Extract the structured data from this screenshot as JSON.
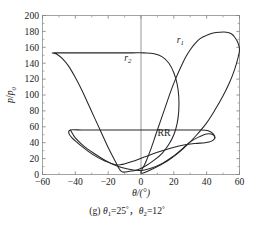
{
  "figure": {
    "caption": "(g) θ1=25°，θ2=12°",
    "caption_parts": {
      "index": "(g)",
      "theta": "θ",
      "sub1": "1",
      "eq1": "=25",
      "deg1": "°",
      "comma": "，",
      "sub2": "2",
      "eq2": "=12",
      "deg2": "°"
    }
  },
  "chart_data": {
    "type": "line",
    "title": "",
    "xlabel": "θ/(°)",
    "ylabel": "p/p0",
    "ylabel_parts": {
      "num": "p",
      "den": "p",
      "den_sub": "0",
      "slash": "/"
    },
    "xlim": [
      -60,
      60
    ],
    "ylim": [
      0,
      200
    ],
    "xticks": [
      -60,
      -40,
      -20,
      0,
      20,
      40,
      60
    ],
    "xticklabels": [
      "-60",
      "-40",
      "-20",
      "0",
      "20",
      "40",
      "60"
    ],
    "yticks": [
      0,
      20,
      40,
      60,
      80,
      100,
      120,
      140,
      160,
      180,
      200
    ],
    "yticklabels": [
      "0",
      "20",
      "40",
      "60",
      "80",
      "100",
      "120",
      "140",
      "160",
      "180",
      "200"
    ],
    "x_minor_interval": 10,
    "y_minor_interval": 10,
    "grid": false,
    "legend": "none",
    "annotations": [
      {
        "text": "r",
        "sub": "1",
        "x": 24,
        "y": 166,
        "name": "curve-label-r1"
      },
      {
        "text": "r",
        "sub": "2",
        "x": -8,
        "y": 143,
        "name": "curve-label-r2"
      },
      {
        "text": "RR",
        "sub": "",
        "x": 14,
        "y": 48,
        "name": "region-label-rr"
      }
    ],
    "vertical_reference_line_x": 0,
    "series": [
      {
        "name": "r1",
        "closed": true,
        "description": "Outer shock polar loop peaking near p/p0 = 180 on the right",
        "points": [
          [
            0,
            2
          ],
          [
            3,
            16
          ],
          [
            6,
            32
          ],
          [
            9,
            50
          ],
          [
            12,
            68
          ],
          [
            15,
            86
          ],
          [
            18,
            104
          ],
          [
            21,
            120
          ],
          [
            24,
            134
          ],
          [
            27,
            147
          ],
          [
            30,
            157
          ],
          [
            33,
            165
          ],
          [
            36,
            171
          ],
          [
            40,
            175
          ],
          [
            44,
            178
          ],
          [
            48,
            179
          ],
          [
            52,
            179
          ],
          [
            55,
            177
          ],
          [
            57,
            173
          ],
          [
            59,
            166
          ],
          [
            60,
            157
          ],
          [
            59,
            146
          ],
          [
            57,
            132
          ],
          [
            54,
            116
          ],
          [
            50,
            99
          ],
          [
            45,
            81
          ],
          [
            40,
            65
          ],
          [
            34,
            50
          ],
          [
            28,
            37
          ],
          [
            22,
            26
          ],
          [
            16,
            17
          ],
          [
            10,
            10
          ],
          [
            5,
            5
          ],
          [
            0,
            2
          ]
        ]
      },
      {
        "name": "r2",
        "closed": true,
        "description": "Left-shifted polar loop with flat top near p/p0 = 153",
        "points": [
          [
            -12,
            4
          ],
          [
            -16,
            18
          ],
          [
            -20,
            34
          ],
          [
            -24,
            52
          ],
          [
            -28,
            70
          ],
          [
            -32,
            88
          ],
          [
            -36,
            106
          ],
          [
            -40,
            122
          ],
          [
            -44,
            136
          ],
          [
            -48,
            146
          ],
          [
            -51,
            151
          ],
          [
            -54,
            153
          ],
          [
            -50,
            153
          ],
          [
            -44,
            153
          ],
          [
            -36,
            153
          ],
          [
            -28,
            153
          ],
          [
            -20,
            153
          ],
          [
            -12,
            153
          ],
          [
            -5,
            153
          ],
          [
            2,
            153
          ],
          [
            8,
            152
          ],
          [
            13,
            148
          ],
          [
            17,
            140
          ],
          [
            20,
            128
          ],
          [
            22,
            114
          ],
          [
            23,
            98
          ],
          [
            23,
            80
          ],
          [
            22,
            64
          ],
          [
            20,
            50
          ],
          [
            17,
            38
          ],
          [
            13,
            27
          ],
          [
            8,
            18
          ],
          [
            3,
            11
          ],
          [
            -2,
            6
          ],
          [
            -7,
            4
          ],
          [
            -12,
            4
          ]
        ]
      },
      {
        "name": "lower-lobe-left",
        "closed": true,
        "description": "Small reflected-shock lobe on the left with flat chord near p/p0 = 56",
        "points": [
          [
            -43,
            56
          ],
          [
            -36,
            56
          ],
          [
            -28,
            56
          ],
          [
            -20,
            56
          ],
          [
            -12,
            56
          ],
          [
            -4,
            56
          ],
          [
            4,
            56
          ],
          [
            12,
            56
          ],
          [
            20,
            56
          ],
          [
            28,
            56
          ],
          [
            36,
            56
          ],
          [
            41,
            55
          ],
          [
            44,
            51
          ],
          [
            45,
            46
          ],
          [
            43,
            42
          ],
          [
            39,
            40
          ],
          [
            33,
            39
          ],
          [
            26,
            37
          ],
          [
            18,
            33
          ],
          [
            10,
            28
          ],
          [
            2,
            22
          ],
          [
            -6,
            16
          ],
          [
            -14,
            12
          ],
          [
            -22,
            17
          ],
          [
            -30,
            26
          ],
          [
            -37,
            37
          ],
          [
            -42,
            46
          ],
          [
            -44,
            52
          ],
          [
            -43,
            56
          ]
        ]
      },
      {
        "name": "lower-lobe-right",
        "closed": false,
        "description": "Right-hand reflected-shock branch forming the RR boundary",
        "points": [
          [
            -43,
            56
          ],
          [
            -40,
            46
          ],
          [
            -35,
            36
          ],
          [
            -29,
            27
          ],
          [
            -22,
            18
          ],
          [
            -15,
            11
          ],
          [
            -8,
            7
          ],
          [
            -1,
            5
          ],
          [
            6,
            8
          ],
          [
            13,
            14
          ],
          [
            19,
            22
          ],
          [
            25,
            32
          ],
          [
            30,
            41
          ],
          [
            35,
            47
          ],
          [
            40,
            51
          ],
          [
            44,
            50
          ],
          [
            45,
            46
          ]
        ]
      }
    ]
  }
}
